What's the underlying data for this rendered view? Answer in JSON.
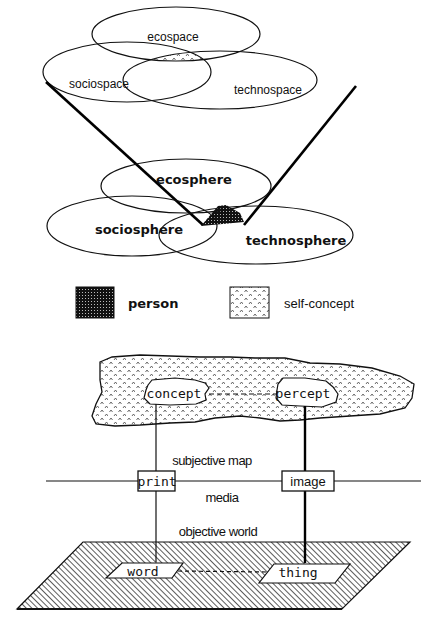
{
  "figure": {
    "top_section": {
      "upper_venn": {
        "circles": [
          {
            "label": "ecospace"
          },
          {
            "label": "sociospace"
          },
          {
            "label": "technospace"
          }
        ],
        "intersection_fill": "self-concept"
      },
      "lower_venn": {
        "circles": [
          {
            "label": "ecosphere"
          },
          {
            "label": "sociosphere"
          },
          {
            "label": "technosphere"
          }
        ],
        "intersection_fill": "person"
      },
      "cone_lines": "connect upper venn edges to lower venn intersection"
    },
    "legend": {
      "items": [
        {
          "label": "person",
          "pattern": "dense-dots-dark"
        },
        {
          "label": "self-concept",
          "pattern": "caret-dots-light"
        }
      ]
    },
    "bottom_section": {
      "cloud": {
        "nodes": [
          {
            "label": "concept"
          },
          {
            "label": "percept"
          }
        ],
        "region_label": "subjective map"
      },
      "media_line": {
        "boxes": [
          {
            "label": "print"
          },
          {
            "label": "image"
          }
        ],
        "region_label": "media"
      },
      "plane": {
        "region_label": "objective world",
        "nodes": [
          {
            "label": "word"
          },
          {
            "label": "thing"
          }
        ]
      }
    }
  }
}
